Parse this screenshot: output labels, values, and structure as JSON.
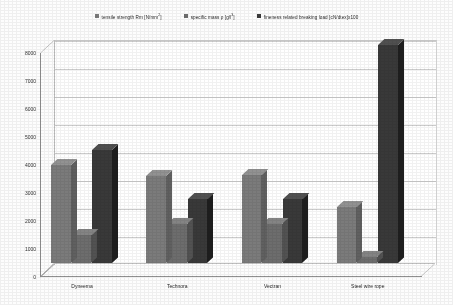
{
  "chart_data": {
    "type": "bar",
    "title": "",
    "subtitle": "",
    "xlabel": "",
    "ylabel": "",
    "grid": true,
    "legend_position": "top",
    "ylim": [
      0,
      8000
    ],
    "ytick_step": 1000,
    "yticks": [
      "0",
      "1000",
      "2000",
      "3000",
      "4000",
      "5000",
      "6000",
      "7000",
      "8000"
    ],
    "categories": [
      "Dyneema",
      "Technora",
      "Vectran",
      "Steel wire rope"
    ],
    "series": [
      {
        "name": "tensile strength Rm [N/mm²]",
        "label_main": "tensile strength Rm [N/mm",
        "label_sup": "2",
        "label_tail": "]",
        "color": "#7b7b7b",
        "values": [
          3500,
          3100,
          3150,
          2000
        ]
      },
      {
        "name": "specific mass ρ [g/l³]",
        "label_main": "specific mass ρ [g/l",
        "label_sup": "3",
        "label_tail": "]",
        "color": "#6e6e6e",
        "values": [
          1000,
          1400,
          1400,
          200
        ]
      },
      {
        "name": "fineness related breaking load [cN/dtex]x100",
        "label_main": "fineness related breaking load [cN/dtex]x100",
        "label_sup": "",
        "label_tail": "",
        "color": "#3c3c3c",
        "values": [
          4050,
          2300,
          2300,
          7800
        ]
      }
    ]
  },
  "colors": {
    "series1": "#7b7b7b",
    "series2": "#6e6e6e",
    "series3": "#3c3c3c",
    "gridline": "#c9c9c9",
    "axis": "#8f8f8f",
    "background": "#fdfdfd",
    "text": "#2b2b2b"
  }
}
